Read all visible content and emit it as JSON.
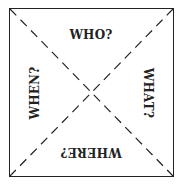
{
  "diagram": {
    "labels": {
      "top": "WHO?",
      "right": "WHAT?",
      "bottom": "WHERE?",
      "left": "WHEN?"
    },
    "line_style": "dashed",
    "colors": {
      "stroke": "#222222",
      "background": "#ffffff"
    }
  }
}
